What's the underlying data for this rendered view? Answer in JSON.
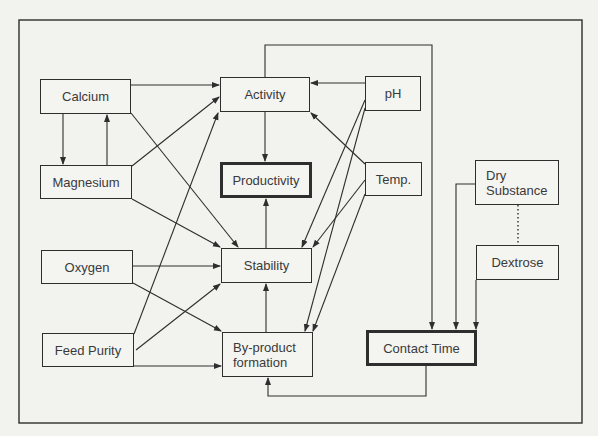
{
  "diagram": {
    "type": "influence-diagram",
    "line_color": "#2e2e2e",
    "background": "#f2f2ef",
    "nodes": {
      "calcium": {
        "label": "Calcium",
        "emphasis": false
      },
      "magnesium": {
        "label": "Magnesium",
        "emphasis": false
      },
      "oxygen": {
        "label": "Oxygen",
        "emphasis": false
      },
      "feed_purity": {
        "label": "Feed Purity",
        "emphasis": false
      },
      "activity": {
        "label": "Activity",
        "emphasis": false
      },
      "productivity": {
        "label": "Productivity",
        "emphasis": true
      },
      "stability": {
        "label": "Stability",
        "emphasis": false
      },
      "byproduct": {
        "label": "By-product\nformation",
        "emphasis": false
      },
      "ph": {
        "label": "pH",
        "emphasis": false
      },
      "temp": {
        "label": "Temp.",
        "emphasis": false
      },
      "contact_time": {
        "label": "Contact Time",
        "emphasis": true
      },
      "dry_substance": {
        "label": "Dry\nSubstance",
        "emphasis": false
      },
      "dextrose": {
        "label": "Dextrose",
        "emphasis": false
      }
    },
    "edges": [
      {
        "from": "Calcium",
        "to": "Activity"
      },
      {
        "from": "Calcium",
        "to": "Magnesium"
      },
      {
        "from": "Magnesium",
        "to": "Calcium"
      },
      {
        "from": "Calcium",
        "to": "Stability"
      },
      {
        "from": "Magnesium",
        "to": "Activity"
      },
      {
        "from": "Magnesium",
        "to": "Stability"
      },
      {
        "from": "Oxygen",
        "to": "Stability"
      },
      {
        "from": "Oxygen",
        "to": "By-product formation"
      },
      {
        "from": "Feed Purity",
        "to": "Activity"
      },
      {
        "from": "Feed Purity",
        "to": "Stability"
      },
      {
        "from": "Feed Purity",
        "to": "By-product formation"
      },
      {
        "from": "pH",
        "to": "Activity"
      },
      {
        "from": "pH",
        "to": "Stability"
      },
      {
        "from": "pH",
        "to": "By-product formation"
      },
      {
        "from": "Temp.",
        "to": "Activity"
      },
      {
        "from": "Temp.",
        "to": "Stability"
      },
      {
        "from": "Temp.",
        "to": "By-product formation"
      },
      {
        "from": "Activity",
        "to": "Productivity"
      },
      {
        "from": "Stability",
        "to": "Productivity"
      },
      {
        "from": "By-product formation",
        "to": "Stability"
      },
      {
        "from": "Activity",
        "to": "Contact Time"
      },
      {
        "from": "Dry Substance",
        "to": "Contact Time"
      },
      {
        "from": "Dextrose",
        "to": "Contact Time"
      },
      {
        "from": "Contact Time",
        "to": "By-product formation"
      },
      {
        "from": "Dry Substance",
        "to": "Dextrose",
        "style": "dotted",
        "directed": false
      }
    ]
  }
}
